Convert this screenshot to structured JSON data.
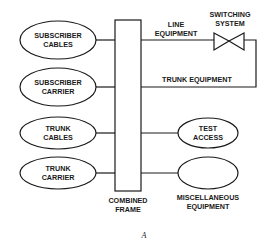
{
  "diagram": {
    "caption": "A",
    "left_nodes": [
      {
        "line1": "SUBSCRIBER",
        "line2": "CABLES"
      },
      {
        "line1": "SUBSCRIBER",
        "line2": "CARRIER"
      },
      {
        "line1": "TRUNK",
        "line2": "CABLES"
      },
      {
        "line1": "TRUNK",
        "line2": "CARRIER"
      }
    ],
    "frame": {
      "line1": "COMBINED",
      "line2": "FRAME"
    },
    "right_nodes": {
      "test_access": {
        "line1": "TEST",
        "line2": "ACCESS"
      },
      "misc": {
        "line1": "MISCELLANEOUS",
        "line2": "EQUIPMENT"
      }
    },
    "line_equipment": {
      "line1": "LINE",
      "line2": "EQUIPMENT"
    },
    "trunk_equipment": "TRUNK EQUIPMENT",
    "switching_system": {
      "line1": "SWITCHING",
      "line2": "SYSTEM"
    }
  }
}
